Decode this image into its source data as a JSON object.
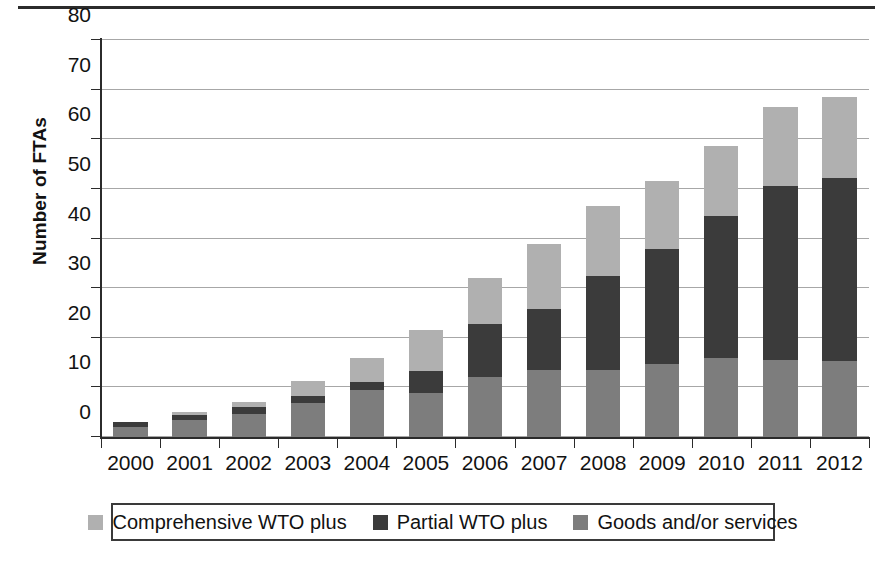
{
  "chart_data": {
    "type": "bar",
    "subtype": "stacked-bar",
    "title": "",
    "xlabel": "",
    "ylabel": "Number of FTAs",
    "ylim": [
      0,
      80
    ],
    "ytick_step": 10,
    "yticks": [
      0,
      10,
      20,
      30,
      40,
      50,
      60,
      70,
      80
    ],
    "grid": true,
    "legend_position": "bottom",
    "categories": [
      "2000",
      "2001",
      "2002",
      "2003",
      "2004",
      "2005",
      "2006",
      "2007",
      "2008",
      "2009",
      "2010",
      "2011",
      "2012"
    ],
    "stack_order_bottom_to_top": [
      "Goods and/or services",
      "Partial WTO plus",
      "Comprehensive WTO plus"
    ],
    "series": [
      {
        "name": "Comprehensive WTO plus",
        "color": "#b0b0b0",
        "values": [
          0.0,
          0.5,
          1.0,
          3.1,
          4.9,
          8.2,
          9.3,
          13.0,
          14.1,
          13.6,
          14.2,
          16.0,
          16.3
        ]
      },
      {
        "name": "Partial WTO plus",
        "color": "#3b3b3b",
        "values": [
          1.0,
          1.0,
          1.3,
          1.4,
          1.5,
          4.5,
          10.7,
          12.2,
          18.8,
          23.1,
          28.5,
          35.0,
          36.8
        ]
      },
      {
        "name": "Goods and/or services",
        "color": "#7d7d7d",
        "values": [
          2.0,
          3.5,
          4.7,
          6.8,
          9.5,
          8.8,
          12.0,
          13.6,
          13.6,
          14.8,
          16.0,
          15.6,
          15.4
        ]
      }
    ],
    "totals": [
      3.0,
      5.0,
      7.0,
      11.3,
      15.9,
      21.5,
      32.0,
      38.8,
      46.5,
      51.5,
      58.7,
      66.6,
      68.5
    ]
  },
  "legend": {
    "items": [
      {
        "label": "Comprehensive WTO plus",
        "color": "#b0b0b0"
      },
      {
        "label": "Partial WTO plus",
        "color": "#3b3b3b"
      },
      {
        "label": "Goods and/or services",
        "color": "#7d7d7d"
      }
    ]
  },
  "axis": {
    "y_title": "Number of FTAs"
  },
  "colors": {
    "axis": "#2b2b2b",
    "gridline": "#a7a7a7",
    "text": "#121212",
    "background": "#ffffff",
    "top_rule": "#2b2b2b",
    "legend_border": "#3a3a3a"
  }
}
